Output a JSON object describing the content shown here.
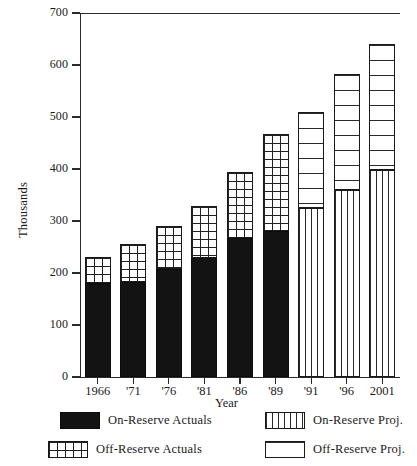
{
  "chart_data": {
    "type": "bar",
    "title": "",
    "subtitle": "",
    "xlabel": "Year",
    "ylabel": "Thousands",
    "stacked": true,
    "grid": false,
    "legend_position": "bottom",
    "ylim": [
      0,
      700
    ],
    "ytick_values": [
      0,
      100,
      200,
      300,
      400,
      500,
      600,
      700
    ],
    "ytick_labels": [
      "0",
      "100",
      "200",
      "300",
      "400",
      "500",
      "600",
      "700"
    ],
    "categories": [
      "1966",
      "'71",
      "'76",
      "'81",
      "'86",
      "'89",
      "'91",
      "'96",
      "2001"
    ],
    "series": [
      {
        "name": "On-Reserve Actuals",
        "pattern": "solid-black",
        "values": [
          180,
          183,
          208,
          228,
          268,
          280,
          null,
          null,
          null
        ]
      },
      {
        "name": "Off-Reserve Actuals",
        "pattern": "cross-hatch-grid",
        "values": [
          50,
          72,
          82,
          100,
          127,
          188,
          null,
          null,
          null
        ]
      },
      {
        "name": "On-Reserve Proj.",
        "pattern": "vertical-stripes",
        "values": [
          null,
          null,
          null,
          null,
          null,
          null,
          325,
          360,
          398
        ]
      },
      {
        "name": "Off-Reserve Proj.",
        "pattern": "horizontal-stripes",
        "values": [
          null,
          null,
          null,
          null,
          null,
          null,
          185,
          222,
          242
        ]
      }
    ],
    "totals": [
      230,
      255,
      290,
      328,
      395,
      468,
      510,
      582,
      640
    ]
  },
  "axes": {
    "y_title": "Thousands",
    "x_title": "Year"
  },
  "legend": {
    "entries": [
      {
        "label": "On-Reserve Actuals",
        "pattern": "solid-black"
      },
      {
        "label": "On-Reserve Proj.",
        "pattern": "vertical-stripes"
      },
      {
        "label": "Off-Reserve Actuals",
        "pattern": "cross-hatch-grid"
      },
      {
        "label": "Off-Reserve Proj.",
        "pattern": "horizontal-stripes"
      }
    ]
  },
  "colors": {
    "ink": "#1a1a1a",
    "axis": "#2b2b2b",
    "solid_fill": "#131313",
    "background": "#ffffff"
  }
}
